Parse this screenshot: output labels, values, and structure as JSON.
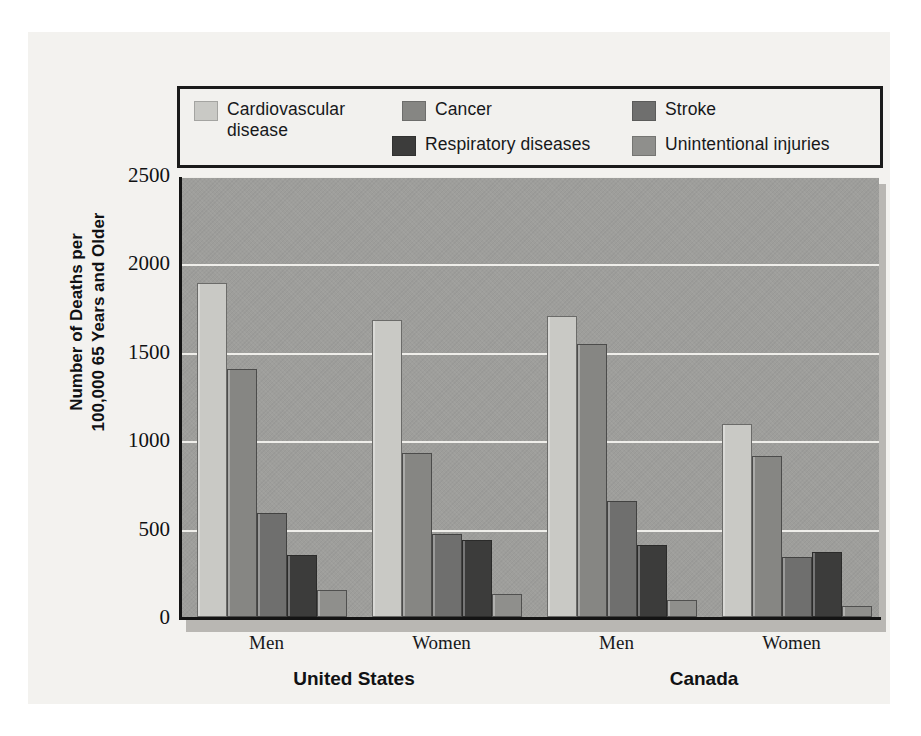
{
  "chart_data": {
    "type": "bar",
    "title": "",
    "xlabel": "",
    "ylabel": "Number of Deaths per\n100,000 65 Years and Older",
    "ylim": [
      0,
      2500
    ],
    "yticks": [
      "0",
      "500",
      "1000",
      "1500",
      "2000",
      "2500"
    ],
    "grid": true,
    "legend_position": "top",
    "groups": [
      {
        "country": "United States",
        "sexes": [
          "Men",
          "Women"
        ]
      },
      {
        "country": "Canada",
        "sexes": [
          "Men",
          "Women"
        ]
      }
    ],
    "categories": [
      "United States - Men",
      "United States - Women",
      "Canada - Men",
      "Canada - Women"
    ],
    "series": [
      {
        "name": "Cardiovascular disease",
        "color": "#c9c9c5",
        "values": [
          1890,
          1680,
          1705,
          1090
        ]
      },
      {
        "name": "Cancer",
        "color": "#868683",
        "values": [
          1405,
          930,
          1545,
          910
        ]
      },
      {
        "name": "Stroke",
        "color": "#6f6f6e",
        "values": [
          590,
          470,
          655,
          340
        ]
      },
      {
        "name": "Respiratory diseases",
        "color": "#3c3c3b",
        "values": [
          350,
          435,
          405,
          365
        ]
      },
      {
        "name": "Unintentional injuries",
        "color": "#8f8f8c",
        "values": [
          150,
          130,
          95,
          65
        ]
      }
    ]
  },
  "legend": {
    "items": [
      {
        "label": "Cardiovascular\ndisease",
        "color": "#c9c9c5"
      },
      {
        "label": "Cancer",
        "color": "#868683"
      },
      {
        "label": "Stroke",
        "color": "#6f6f6e"
      },
      {
        "label": "Respiratory diseases",
        "color": "#3c3c3b"
      },
      {
        "label": "Unintentional injuries",
        "color": "#8f8f8c"
      }
    ]
  },
  "axis": {
    "y_title": "Number of Deaths per\n100,000 65 Years and Older",
    "y_ticks": [
      "2500",
      "2000",
      "1500",
      "1000",
      "500",
      "0"
    ]
  },
  "x_labels": [
    "Men",
    "Women",
    "Men",
    "Women"
  ],
  "group_labels": [
    "United States",
    "Canada"
  ],
  "colors": {
    "plot_background": "#9e9e9b",
    "gridline": "#efeeea",
    "axis": "#141414",
    "page": "#f3f2ef"
  }
}
